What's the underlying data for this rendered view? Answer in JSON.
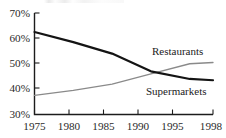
{
  "chart_data": {
    "type": "line",
    "title": "",
    "xlabel": "",
    "ylabel": "",
    "x": [
      1975,
      1980,
      1985,
      1990,
      1995,
      1998
    ],
    "categories": [
      "1975",
      "1980",
      "1985",
      "1990",
      "1995",
      "1998"
    ],
    "xlim": [
      1975,
      1998
    ],
    "ylim": [
      30,
      70
    ],
    "ytick_labels": [
      "70%",
      "60%",
      "50%",
      "40%",
      "30%"
    ],
    "ytick_values": [
      70,
      60,
      50,
      40,
      30
    ],
    "xtick_labels": [
      "1975",
      "1980",
      "1985",
      "1990",
      "1995",
      "1998"
    ],
    "grid": false,
    "legend_position": "inline-annotations",
    "series": [
      {
        "name": "Restaurants",
        "color": "#141414",
        "line_width": 2.2,
        "values": [
          62.5,
          58.5,
          54.0,
          47.0,
          44.0,
          43.5
        ]
      },
      {
        "name": "Supermarkets",
        "color": "#8a8a8a",
        "line_width": 1.3,
        "values": [
          37.5,
          39.5,
          42.0,
          46.0,
          50.0,
          50.5
        ]
      }
    ],
    "annotations": [
      {
        "text": "Restaurants",
        "x": 1993,
        "y": 54.5
      },
      {
        "text": "Supermarkets",
        "x": 1993,
        "y": 40.5
      }
    ]
  },
  "axis": {
    "y_labels": [
      "70%",
      "60%",
      "50%",
      "40%",
      "30%"
    ],
    "x_labels": [
      "1975",
      "1980",
      "1985",
      "1990",
      "1995",
      "1998"
    ]
  }
}
